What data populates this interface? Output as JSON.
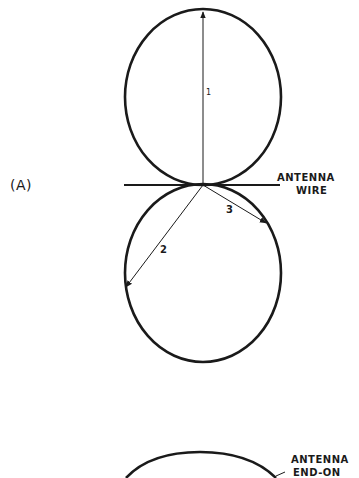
{
  "figure": {
    "panel_label": "(A)",
    "labels": {
      "antenna_wire_line1": "ANTENNA",
      "antenna_wire_line2": "WIRE",
      "vector_1": "1",
      "vector_2": "2",
      "vector_3": "3",
      "end_on_line1": "ANTENNA",
      "end_on_line2": "END-ON"
    },
    "colors": {
      "line": "#1a1a1a",
      "background": "#ffffff"
    }
  }
}
